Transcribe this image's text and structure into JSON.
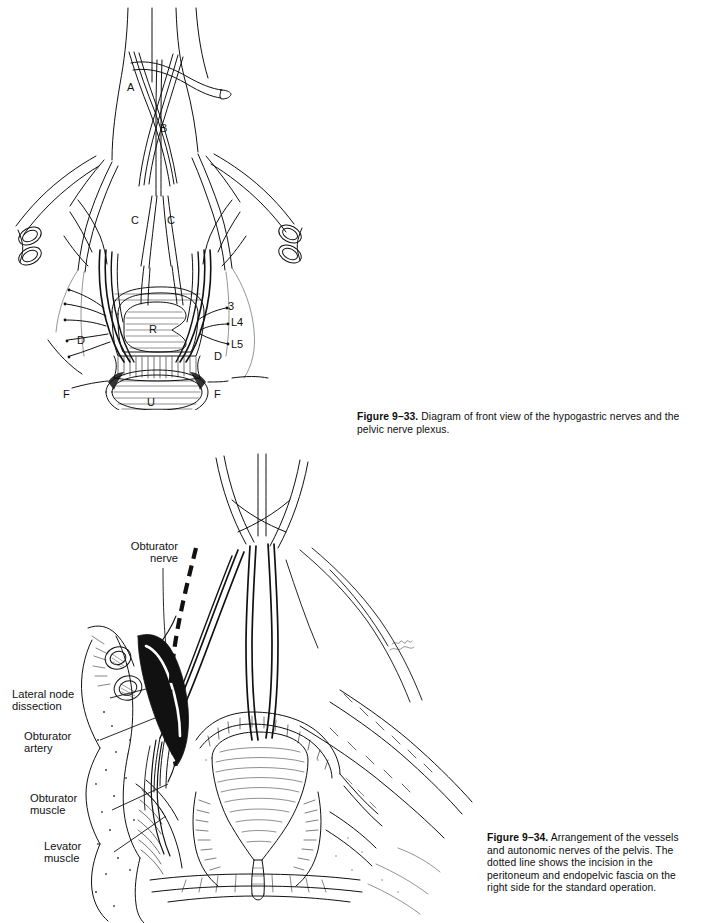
{
  "page": {
    "background_color": "#ffffff",
    "ink_color": "#111111",
    "width": 704,
    "height": 923
  },
  "figures": [
    {
      "id": "figure-9-33",
      "caption": {
        "label": "Figure 9–33.",
        "text": " Diagram of front view of the hypogastric nerves and the pelvic nerve plexus."
      },
      "labels": [
        {
          "key": "A",
          "text": "A",
          "type": "letter",
          "x": 127,
          "y": 81
        },
        {
          "key": "B",
          "text": "B",
          "type": "letter",
          "x": 160,
          "y": 122
        },
        {
          "key": "C1",
          "text": "C",
          "type": "letter",
          "x": 131,
          "y": 214
        },
        {
          "key": "C2",
          "text": "C",
          "type": "letter",
          "x": 167,
          "y": 214
        },
        {
          "key": "D1",
          "text": "D",
          "type": "letter",
          "x": 77,
          "y": 334
        },
        {
          "key": "D2",
          "text": "D",
          "type": "letter",
          "x": 214,
          "y": 350
        },
        {
          "key": "F1",
          "text": "F",
          "type": "letter",
          "x": 63,
          "y": 388
        },
        {
          "key": "F2",
          "text": "F",
          "type": "letter",
          "x": 214,
          "y": 388
        },
        {
          "key": "R",
          "text": "R",
          "type": "letter",
          "x": 149,
          "y": 330
        },
        {
          "key": "U",
          "text": "U",
          "type": "letter",
          "x": 147,
          "y": 405
        },
        {
          "key": "N3",
          "text": "3",
          "type": "letter",
          "x": 228,
          "y": 306
        },
        {
          "key": "L4",
          "text": "L4",
          "type": "letter",
          "x": 231,
          "y": 322
        },
        {
          "key": "L5",
          "text": "L5",
          "type": "letter",
          "x": 231,
          "y": 344
        }
      ]
    },
    {
      "id": "figure-9-34",
      "caption": {
        "label": "Figure 9–34.",
        "text": " Arrangement of the vessels and autonomic nerves of the pelvis. The dotted line shows the incision in the peritoneum and endopelvic fascia on the right side for the standard operation."
      },
      "labels": [
        {
          "key": "obturator-nerve",
          "text": "Obturator\nnerve",
          "type": "word",
          "x": 136,
          "y": 545
        },
        {
          "key": "lateral-node-dissection",
          "text": "Lateral node\ndissection",
          "type": "word",
          "x": 20,
          "y": 692
        },
        {
          "key": "obturator-artery",
          "text": "Obturator\nartery",
          "type": "word",
          "x": 37,
          "y": 733
        },
        {
          "key": "obturator-muscle",
          "text": "Obturator\nmuscle",
          "type": "word",
          "x": 43,
          "y": 795
        },
        {
          "key": "levator-muscle",
          "text": "Levator\nmuscle",
          "type": "word",
          "x": 56,
          "y": 842
        }
      ]
    }
  ]
}
